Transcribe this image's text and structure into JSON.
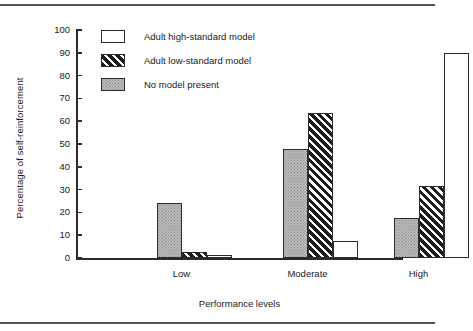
{
  "chart_data": {
    "type": "bar",
    "title": "",
    "xlabel": "Performance levels",
    "ylabel": "Percentage of self-reinforcement",
    "categories": [
      "Low",
      "Moderate",
      "High"
    ],
    "ylim": [
      0,
      100
    ],
    "yticks": [
      0,
      10,
      20,
      30,
      40,
      50,
      60,
      70,
      80,
      90,
      100
    ],
    "ytick_labels": [
      "0",
      "10",
      "20",
      "30",
      "40",
      "50",
      "60",
      "70",
      "80",
      "90",
      "100"
    ],
    "grid": false,
    "legend_position": "upper-left-inside",
    "series": [
      {
        "name": "No model present",
        "fill": "gray-stipple",
        "values": [
          24,
          48,
          17.5
        ]
      },
      {
        "name": "Adult low-standard model",
        "fill": "black-diagonal-hatch",
        "values": [
          2.5,
          63.5,
          31.5
        ]
      },
      {
        "name": "Adult high-standard model",
        "fill": "white",
        "values": [
          1.2,
          7.5,
          90
        ]
      }
    ],
    "legend_entries": [
      {
        "label": "Adult high-standard model",
        "fill": "white"
      },
      {
        "label": "Adult low-standard model",
        "fill": "black-diagonal-hatch"
      },
      {
        "label": "No model present",
        "fill": "gray-stipple"
      }
    ],
    "colors": {
      "axis": "#2b2b2b",
      "white_fill": "#ffffff",
      "hatch_fill": "#1c1c1c",
      "gray_fill": "#b9b9b9",
      "rule": "#555555"
    }
  }
}
